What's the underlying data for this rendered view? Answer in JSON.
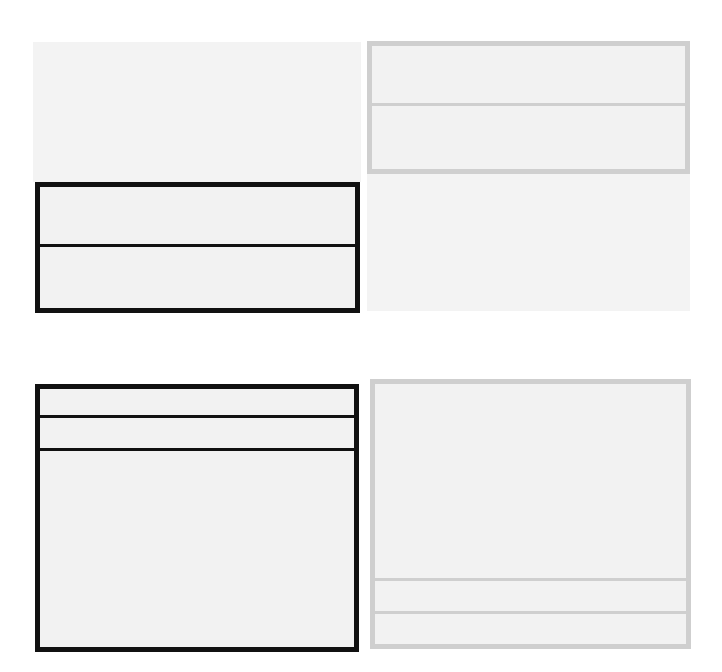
{
  "figure": {
    "colors": {
      "background": "#ffffff",
      "panel_fill": "#f3f3f3",
      "dark_border": "#111111",
      "light_border": "#cfcfcf"
    },
    "panels": [
      {
        "id": "top-left",
        "bg": {
          "x": 33,
          "y": 42,
          "w": 328,
          "h": 140
        },
        "box": {
          "x": 35,
          "y": 182,
          "w": 325,
          "h": 131,
          "border": 5,
          "style": "dark"
        },
        "dividers_y": [
          62
        ],
        "divider_thickness": 3
      },
      {
        "id": "top-right",
        "bg": {
          "x": 367,
          "y": 174,
          "w": 323,
          "h": 137
        },
        "box": {
          "x": 367,
          "y": 41,
          "w": 323,
          "h": 133,
          "border": 5,
          "style": "light"
        },
        "dividers_y": [
          62
        ],
        "divider_thickness": 3
      },
      {
        "id": "bottom-left",
        "bg": null,
        "box": {
          "x": 35,
          "y": 384,
          "w": 324,
          "h": 268,
          "border": 5,
          "style": "dark"
        },
        "dividers_y": [
          31,
          64
        ],
        "divider_thickness": 3
      },
      {
        "id": "bottom-right",
        "bg": null,
        "box": {
          "x": 370,
          "y": 379,
          "w": 321,
          "h": 270,
          "border": 5,
          "style": "light"
        },
        "dividers_y": [
          199,
          232
        ],
        "divider_thickness": 3
      }
    ]
  }
}
